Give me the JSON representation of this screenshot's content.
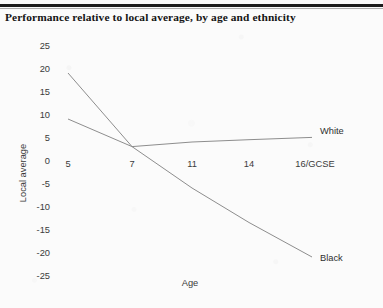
{
  "title": "Performance relative to local average, by age and ethnicity",
  "axis": {
    "ylabel": "Local average",
    "xlabel": "Age"
  },
  "legend": {
    "white": "White",
    "black": "Black"
  },
  "colors": {
    "line": "#8d8d8d",
    "text": "#3a3a3a",
    "rule": "#1d1d1d",
    "paper": "#fbfbfb"
  },
  "chart_data": {
    "type": "line",
    "title": "Performance relative to local average, by age and ethnicity",
    "xlabel": "Age",
    "ylabel": "Local average",
    "categories": [
      "5",
      "7",
      "11",
      "14",
      "16/GCSE"
    ],
    "ylim": [
      -25,
      25
    ],
    "yticks": [
      25,
      20,
      15,
      10,
      5,
      0,
      -5,
      -10,
      -15,
      -20,
      -25
    ],
    "grid": false,
    "legend_position": "inline-right",
    "series": [
      {
        "name": "White",
        "values": [
          10,
          4,
          5,
          5.5,
          6
        ]
      },
      {
        "name": "Black",
        "values": [
          20,
          4,
          -5,
          -12.5,
          -20
        ]
      }
    ]
  }
}
